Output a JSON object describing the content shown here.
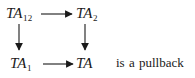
{
  "figure": {
    "kind": "commutative-square",
    "background_color": "#ffffff",
    "ink_color": "#1a1a1a",
    "objects": [
      {
        "id": "top-left",
        "base": "TA",
        "subscript": "12"
      },
      {
        "id": "top-right",
        "base": "TA",
        "subscript": "2"
      },
      {
        "id": "bottom-left",
        "base": "TA",
        "subscript": "1"
      },
      {
        "id": "bottom-right",
        "base": "TA",
        "subscript": ""
      }
    ],
    "arrows": [
      {
        "id": "top",
        "from": "top-left",
        "to": "top-right",
        "direction": "right",
        "label": ""
      },
      {
        "id": "left",
        "from": "top-left",
        "to": "bottom-left",
        "direction": "down",
        "label": ""
      },
      {
        "id": "right",
        "from": "top-right",
        "to": "bottom-right",
        "direction": "down",
        "label": ""
      },
      {
        "id": "bottom",
        "from": "bottom-left",
        "to": "bottom-right",
        "direction": "right",
        "label": ""
      }
    ],
    "caption": "is a pullback"
  }
}
